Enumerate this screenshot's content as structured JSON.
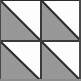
{
  "figure": {
    "title": "Two-by-two tiling of half-square triangle tiles",
    "type": "geometric-tiling",
    "width": 81,
    "height": 81,
    "grid": {
      "rows": 2,
      "columns": 2,
      "cell_width": 40,
      "cell_height": 40
    },
    "colors": {
      "fill_gray": "#989898",
      "fill_white": "#fdfdfd",
      "line_dark": "#2b2b2b",
      "line_mid": "#6a6a6a",
      "background": "#ffffff"
    },
    "stroke": {
      "outer_border_width": 2,
      "divider_width": 2,
      "diagonal_width": 2
    },
    "tiles": [
      {
        "id": "tile-top-left",
        "row": 0,
        "column": 0,
        "x": 0,
        "y": 0,
        "diagonal": "top-left-to-bottom-right",
        "gray_triangle": "lower-left",
        "white_triangle": "upper-right"
      },
      {
        "id": "tile-top-right",
        "row": 0,
        "column": 1,
        "x": 40,
        "y": 0,
        "diagonal": "top-left-to-bottom-right",
        "gray_triangle": "lower-left",
        "white_triangle": "upper-right"
      },
      {
        "id": "tile-bottom-left",
        "row": 1,
        "column": 0,
        "x": 0,
        "y": 40,
        "diagonal": "top-left-to-bottom-right",
        "gray_triangle": "lower-left",
        "white_triangle": "upper-right"
      },
      {
        "id": "tile-bottom-right",
        "row": 1,
        "column": 1,
        "x": 40,
        "y": 40,
        "diagonal": "top-left-to-bottom-right",
        "gray_triangle": "lower-left",
        "white_triangle": "upper-right"
      }
    ]
  }
}
